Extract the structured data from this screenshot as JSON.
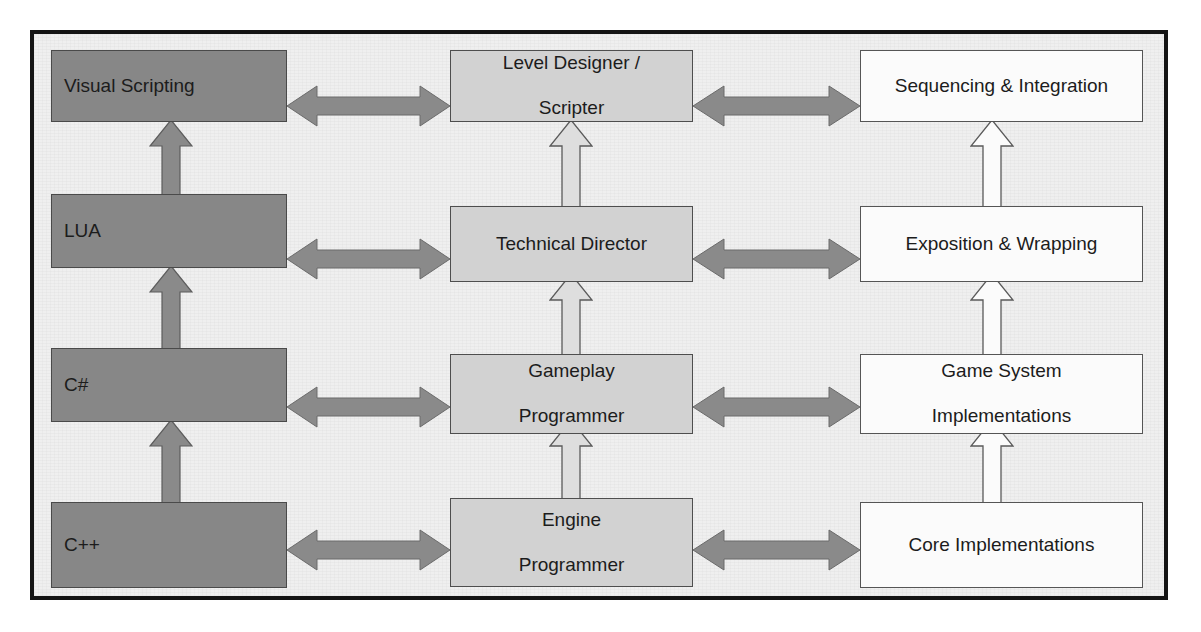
{
  "diagram": {
    "columns": [
      {
        "id": "languages",
        "name": "Languages / Scripting",
        "fill": "#878787",
        "text_align": "left"
      },
      {
        "id": "roles",
        "name": "Roles",
        "fill": "#d2d2d2",
        "text_align": "center"
      },
      {
        "id": "tasks",
        "name": "Tasks",
        "fill": "#fbfbfb",
        "text_align": "center"
      }
    ],
    "rows": [
      {
        "language": "Visual Scripting",
        "role_line1": "Level Designer /",
        "role_line2": "Scripter",
        "task": "Sequencing & Integration"
      },
      {
        "language": "LUA",
        "role_line1": "Technical Director",
        "role_line2": "",
        "task": "Exposition & Wrapping"
      },
      {
        "language": "C#",
        "role_line1": "Gameplay",
        "role_line2": "Programmer",
        "task": "Game System Implementations"
      },
      {
        "language": "C++",
        "role_line1": "Engine",
        "role_line2": "Programmer",
        "task": "Core Implementations"
      }
    ],
    "task_lines": [
      {
        "line1": "Sequencing & Integration",
        "line2": ""
      },
      {
        "line1": "Exposition & Wrapping",
        "line2": ""
      },
      {
        "line1": "Game System",
        "line2": "Implementations"
      },
      {
        "line1": "Core Implementations",
        "line2": ""
      }
    ],
    "connectors": {
      "horizontal_left_to_middle": "bidirectional-arrow",
      "horizontal_middle_to_right": "bidirectional-arrow",
      "vertical_upward": "upward-arrow",
      "count_horizontal": 8,
      "count_vertical": 9
    },
    "colors": {
      "frame_border": "#141414",
      "background": "#efefef",
      "language_box_fill": "#878787",
      "role_box_fill": "#d2d2d2",
      "task_box_fill": "#fbfbfb",
      "arrow_dark_fill": "#8a8a8a",
      "arrow_light_fill": "#d8d8d8",
      "arrow_white_fill": "#fafafa",
      "arrow_stroke": "#555555",
      "text": "#1c1c1c"
    }
  }
}
